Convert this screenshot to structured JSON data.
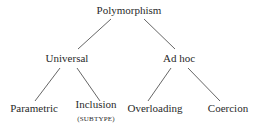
{
  "diagram": {
    "type": "tree",
    "root": {
      "label": "Polymorphism",
      "children": [
        {
          "label": "Universal",
          "children": [
            {
              "label": "Parametric"
            },
            {
              "label": "Inclusion",
              "sublabel": "(SUBTYPE)"
            }
          ]
        },
        {
          "label": "Ad hoc",
          "children": [
            {
              "label": "Overloading"
            },
            {
              "label": "Coercion"
            }
          ]
        }
      ]
    },
    "colors": {
      "text": "#2a2a2a",
      "edge": "#555555",
      "background": "#ffffff"
    }
  },
  "nodes": {
    "polymorphism": "Polymorphism",
    "universal": "Universal",
    "adhoc": "Ad hoc",
    "parametric": "Parametric",
    "inclusion": "Inclusion",
    "inclusion_sub": "(SUBTYPE)",
    "overloading": "Overloading",
    "coercion": "Coercion"
  }
}
